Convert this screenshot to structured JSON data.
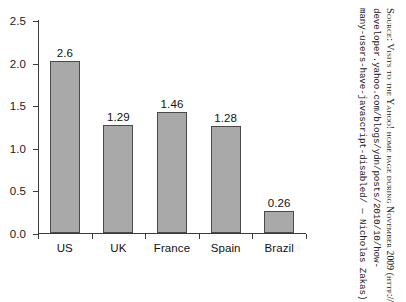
{
  "chart_data": {
    "type": "bar",
    "title": "",
    "xlabel": "",
    "ylabel": "",
    "categories": [
      "US",
      "UK",
      "France",
      "Spain",
      "Brazil"
    ],
    "values": [
      2.03,
      1.28,
      1.43,
      1.27,
      0.27
    ],
    "labels": [
      "2.6",
      "1.29",
      "1.46",
      "1.28",
      "0.26"
    ],
    "ylim": [
      0.0,
      2.5
    ],
    "ytick_labels": [
      "0.0",
      "0.5",
      "1.0",
      "1.5",
      "2.0",
      "2.5"
    ],
    "ytick_values": [
      0.0,
      0.5,
      1.0,
      1.5,
      2.0,
      2.5
    ],
    "grid": false,
    "legend": false,
    "bar_color": "#a9a9a9",
    "bar_edge_color": "#4a4a4a",
    "axis_color": "#3b3b3b",
    "text_color": "#111111",
    "background": "#ffffff"
  },
  "source_note": {
    "line1_prefix": "Source:",
    "line1": "Source: Visits to the Yahoo! home page during November 2009 (http://",
    "line2": "developer.yahoo.com/blogs/ydn/posts/2010/10/how-",
    "line3": "many-users-have-javascript-disabled/ — Nicholas Zakas)"
  }
}
